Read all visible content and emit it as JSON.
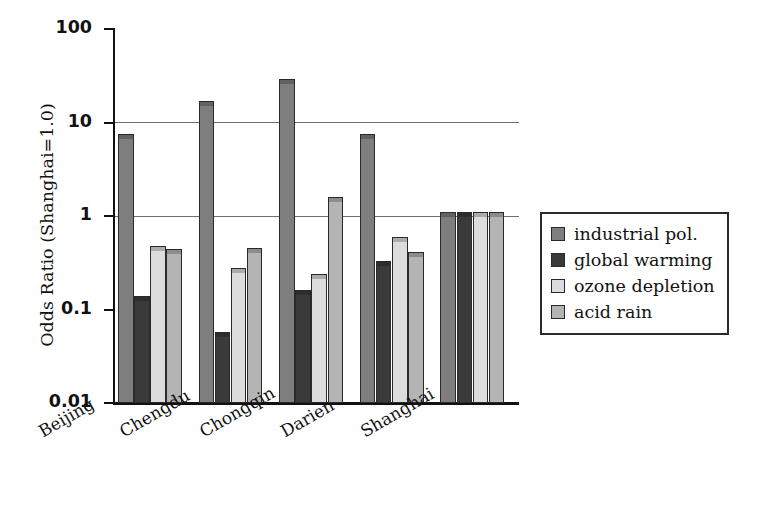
{
  "chart_data": {
    "type": "bar",
    "title": "",
    "xlabel": "",
    "ylabel": "Odds Ratio (Shanghai=1.0)",
    "yscale": "log",
    "ylim": [
      0.01,
      100
    ],
    "ytick_labels": [
      "100",
      "10",
      "1",
      "0.1",
      "0.01"
    ],
    "ytick_values": [
      100,
      10,
      1,
      0.1,
      0.01
    ],
    "grid": "horizontal gridlines at y=10 and y=1",
    "legend_position": "right",
    "categories": [
      "Beijing",
      "Chengdu",
      "Chongqin",
      "Darien",
      "Shanghai"
    ],
    "series": [
      {
        "name": "industrial pol.",
        "color": "#7e7e7e",
        "values": [
          7.5,
          17.0,
          29.0,
          7.6,
          1.1
        ]
      },
      {
        "name": "global warming",
        "color": "#3a3a3a",
        "values": [
          0.14,
          0.057,
          0.16,
          0.33,
          1.1
        ]
      },
      {
        "name": "ozone depletion",
        "color": "#dcdcdc",
        "values": [
          0.48,
          0.28,
          0.24,
          0.6,
          1.1
        ]
      },
      {
        "name": "acid rain",
        "color": "#b4b4b4",
        "values": [
          0.44,
          0.45,
          1.6,
          0.41,
          1.1
        ]
      }
    ]
  },
  "legend": {
    "items": [
      {
        "label": "industrial pol."
      },
      {
        "label": "global warming"
      },
      {
        "label": "ozone depletion"
      },
      {
        "label": "acid rain"
      }
    ]
  },
  "axes": {
    "y_title": "Odds Ratio (Shanghai=1.0)",
    "y_ticks": [
      {
        "label": "100"
      },
      {
        "label": "10"
      },
      {
        "label": "1"
      },
      {
        "label": "0.1"
      },
      {
        "label": "0.01"
      }
    ],
    "x_ticks": [
      {
        "label": "Beijing"
      },
      {
        "label": "Chengdu"
      },
      {
        "label": "Chongqin"
      },
      {
        "label": "Darien"
      },
      {
        "label": "Shanghai"
      }
    ]
  }
}
